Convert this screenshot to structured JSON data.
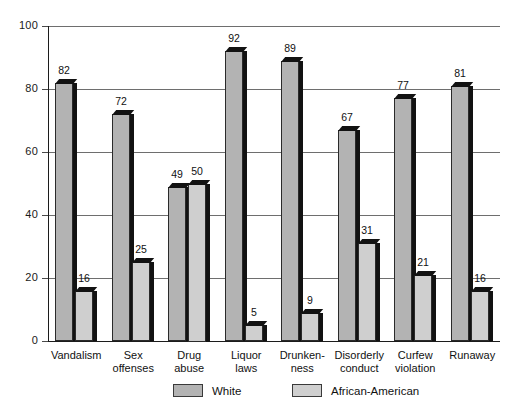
{
  "chart_data": {
    "type": "bar",
    "title": "",
    "subtitle": "",
    "xlabel": "",
    "ylabel": "",
    "ylim": [
      0,
      100
    ],
    "yticks": [
      0,
      20,
      40,
      60,
      80,
      100
    ],
    "grid": true,
    "legend_position": "bottom",
    "categories": [
      "Vandalism",
      "Sex\noffenses",
      "Drug\nabuse",
      "Liquor\nlaws",
      "Drunken-\nness",
      "Disorderly\nconduct",
      "Curfew\nviolation",
      "Runaway"
    ],
    "series": [
      {
        "name": "White",
        "color": "#b3b3b3",
        "values": [
          82,
          72,
          49,
          92,
          89,
          67,
          77,
          81
        ]
      },
      {
        "name": "African-American",
        "color": "#cfcfcf",
        "values": [
          16,
          25,
          50,
          5,
          9,
          31,
          21,
          16
        ]
      }
    ]
  },
  "axis": {
    "y_tick_labels": [
      "100",
      "80",
      "60",
      "40",
      "20",
      "0"
    ]
  },
  "legend": {
    "items": [
      {
        "label": "White"
      },
      {
        "label": "African-American"
      }
    ]
  },
  "colors": {
    "bar_white": "#b3b3b3",
    "bar_african_american": "#cfcfcf",
    "bar_shadow": "#121212",
    "gridline": "#6e6e6e",
    "axis": "#1c1c1c",
    "text": "#111111",
    "background": "#ffffff"
  }
}
